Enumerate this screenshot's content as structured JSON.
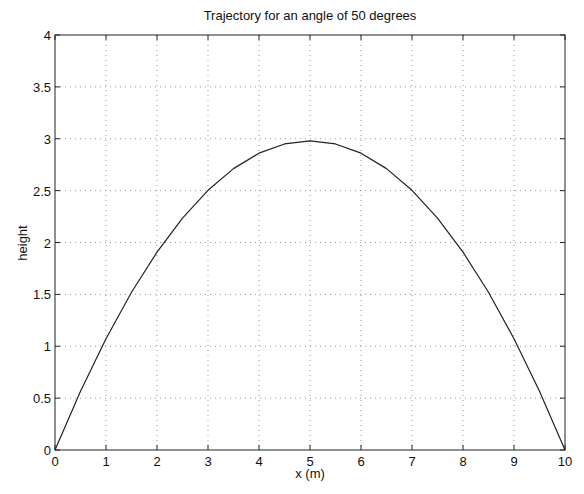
{
  "chart_data": {
    "type": "line",
    "title": "Trajectory for an angle of 50 degrees",
    "xlabel": "x (m)",
    "ylabel": "height",
    "xlim": [
      0,
      10
    ],
    "ylim": [
      0,
      4
    ],
    "xticks": [
      0,
      1,
      2,
      3,
      4,
      5,
      6,
      7,
      8,
      9,
      10
    ],
    "xtick_labels": [
      "0",
      "1",
      "2",
      "3",
      "4",
      "5",
      "6",
      "7",
      "8",
      "9",
      "10"
    ],
    "yticks": [
      0,
      0.5,
      1,
      1.5,
      2,
      2.5,
      3,
      3.5,
      4
    ],
    "ytick_labels": [
      "0",
      "0.5",
      "1",
      "1.5",
      "2",
      "2.5",
      "3",
      "3.5",
      "4"
    ],
    "grid": true,
    "grid_style": "dotted",
    "legend": null,
    "series": [
      {
        "name": "trajectory",
        "color": "#222222",
        "x": [
          0,
          0.5,
          1,
          1.5,
          2,
          2.5,
          3,
          3.5,
          4,
          4.5,
          5,
          5.5,
          6,
          6.5,
          7,
          7.5,
          8,
          8.5,
          9,
          9.5,
          10
        ],
        "y": [
          0,
          0.566,
          1.073,
          1.52,
          1.907,
          2.235,
          2.503,
          2.712,
          2.861,
          2.95,
          2.98,
          2.95,
          2.861,
          2.712,
          2.503,
          2.235,
          1.907,
          1.52,
          1.073,
          0.566,
          0
        ]
      }
    ]
  },
  "plot": {
    "left": 55,
    "top": 35,
    "right": 565,
    "bottom": 450
  }
}
